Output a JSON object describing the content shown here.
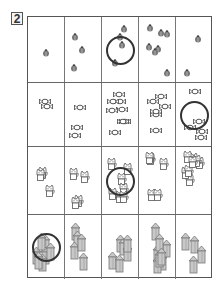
{
  "puzzle": {
    "number": "2",
    "columns": 5,
    "rows": [
      {
        "object": "bug",
        "icon": "bug-icon",
        "counts": [
          1,
          3,
          4,
          7,
          2
        ],
        "circled_column": 2
      },
      {
        "object": "candy",
        "icon": "candy-icon",
        "counts": [
          2,
          3,
          8,
          6,
          5
        ],
        "circled_column": 4
      },
      {
        "object": "cat",
        "icon": "cat-icon",
        "counts": [
          3,
          4,
          7,
          5,
          8
        ],
        "circled_column": 2
      },
      {
        "object": "house",
        "icon": "house-icon",
        "counts": [
          7,
          5,
          6,
          8,
          4
        ],
        "circled_column": 0
      }
    ]
  },
  "colors": {
    "line": "#555555",
    "circle": "#333333",
    "bug": "#777777",
    "candy": "#444444",
    "cat": "#555555",
    "house_fill": "#c8c8c8",
    "house_stroke": "#777777"
  }
}
